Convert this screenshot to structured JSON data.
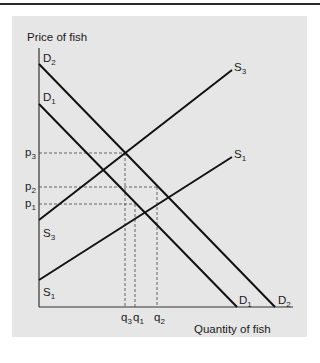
{
  "figure": {
    "y_axis_label": "Price of fish",
    "x_axis_label": "Quantity of fish",
    "curves": [
      {
        "id": "D2",
        "kind": "demand",
        "name": "D",
        "sub": "2",
        "x1": 39,
        "y1": 64,
        "x2": 275,
        "y2": 307
      },
      {
        "id": "D1",
        "kind": "demand",
        "name": "D",
        "sub": "1",
        "x1": 39,
        "y1": 104,
        "x2": 237,
        "y2": 307
      },
      {
        "id": "S3",
        "kind": "supply",
        "name": "S",
        "sub": "3",
        "x1": 39,
        "y1": 220,
        "x2": 232,
        "y2": 70
      },
      {
        "id": "S1",
        "kind": "supply",
        "name": "S",
        "sub": "1",
        "x1": 39,
        "y1": 280,
        "x2": 232,
        "y2": 157
      }
    ],
    "curve_labels": [
      {
        "for": "D2-top",
        "name": "D",
        "sub": "2",
        "x": 43,
        "y": 62
      },
      {
        "for": "D1-top",
        "name": "D",
        "sub": "1",
        "x": 43,
        "y": 101
      },
      {
        "for": "S3-top",
        "name": "S",
        "sub": "3",
        "x": 234,
        "y": 71
      },
      {
        "for": "S1-top",
        "name": "S",
        "sub": "1",
        "x": 234,
        "y": 158
      },
      {
        "for": "S3-bottom",
        "name": "S",
        "sub": "3",
        "x": 43,
        "y": 237
      },
      {
        "for": "S1-bottom",
        "name": "S",
        "sub": "1",
        "x": 43,
        "y": 296
      },
      {
        "for": "D1-bottom",
        "name": "D",
        "sub": "1",
        "x": 239,
        "y": 304
      },
      {
        "for": "D2-bottom",
        "name": "D",
        "sub": "2",
        "x": 278,
        "y": 304
      }
    ],
    "price_levels": [
      {
        "name": "p",
        "sub": "3",
        "y": 153
      },
      {
        "name": "p",
        "sub": "2",
        "y": 187
      },
      {
        "name": "p",
        "sub": "1",
        "y": 204
      }
    ],
    "equilibria": [
      {
        "id": "E3",
        "desc": "S3 x D1",
        "x": 125,
        "y": 153,
        "price": "p3",
        "quantity": "q3"
      },
      {
        "id": "E2",
        "desc": "S1 x D2",
        "x": 157,
        "y": 187,
        "price": "p2",
        "quantity": "q2"
      },
      {
        "id": "E1",
        "desc": "S1 x D1",
        "x": 135,
        "y": 204,
        "price": "p1",
        "quantity": "q1"
      }
    ],
    "quantity_labels": [
      {
        "name": "q",
        "sub": "3",
        "x": 121
      },
      {
        "name": "q",
        "sub": "1",
        "x": 133
      },
      {
        "name": "q",
        "sub": "2",
        "x": 154
      }
    ],
    "colors": {
      "panel": "#e6e6e6",
      "line": "#111111",
      "axis": "#333333",
      "dashed": "#555555",
      "rule": "#2a2a2a"
    }
  }
}
